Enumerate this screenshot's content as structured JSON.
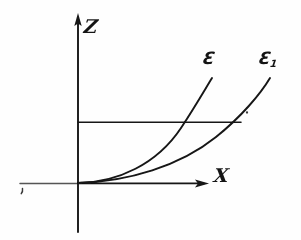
{
  "figure": {
    "kind": "coordinate-diagram",
    "background_color": "#fefefe",
    "ink_color": "#141414",
    "axes": {
      "vertical": {
        "name": "z-axis",
        "label": "Z",
        "arrow": "up",
        "x": 78,
        "y_top": 18,
        "y_bottom": 232,
        "label_x": 88,
        "label_y": 28
      },
      "horizontal": {
        "name": "x-axis",
        "label": "X",
        "arrow": "right",
        "y": 183,
        "x_left": 20,
        "x_right": 207,
        "label_x": 222,
        "label_y": 178
      },
      "origin": {
        "x": 78,
        "y": 183
      }
    },
    "reference_line": {
      "name": "horizontal-reference-line",
      "y": 122,
      "x_start": 78,
      "x_end": 241
    },
    "curves": [
      {
        "name": "curve-epsilon",
        "label": "Ɛ",
        "label_sub": "",
        "label_x": 207,
        "label_y": 58,
        "path": "M 78 183 C 120 182, 160 162, 183 125 C 197 103, 206 88, 212 78",
        "end_point": {
          "x": 212,
          "y": 78
        }
      },
      {
        "name": "curve-epsilon-1",
        "label": "Ɛ",
        "label_sub": "1",
        "label_x": 263,
        "label_y": 58,
        "path": "M 78 183 C 130 181, 182 164, 218 135 C 243 115, 261 93, 270 78",
        "end_point": {
          "x": 270,
          "y": 78
        }
      }
    ],
    "marks": [
      {
        "name": "left-tick-mark",
        "x": 22,
        "y": 190,
        "kind": "comma-artifact"
      },
      {
        "name": "intersection-dot",
        "x": 247,
        "y": 112,
        "kind": "dot-artifact"
      }
    ]
  }
}
